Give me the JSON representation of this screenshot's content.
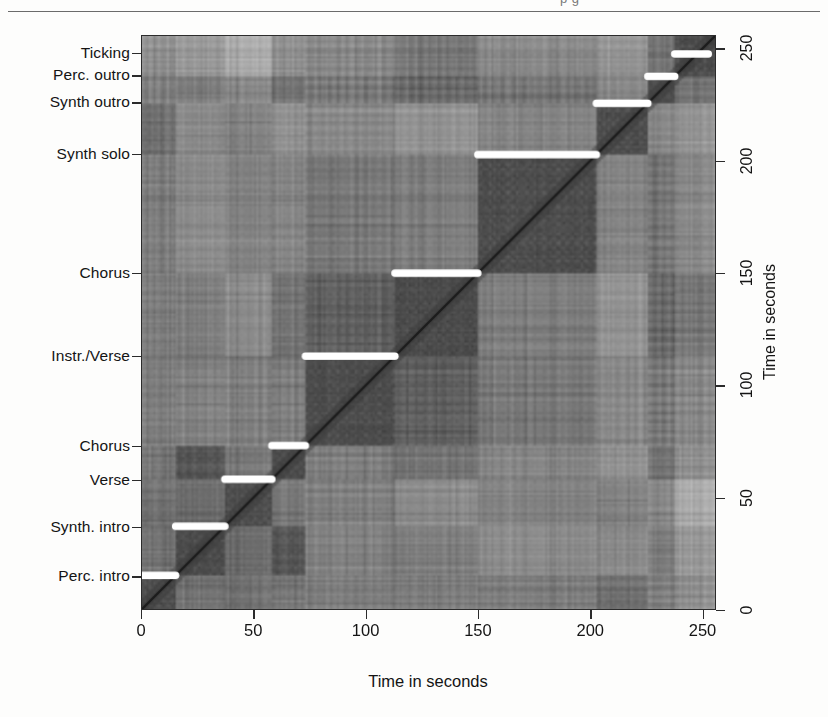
{
  "page": {
    "cut_off_header_text": "p   g",
    "has_horizontal_rule": true
  },
  "figure": {
    "type": "self-similarity-matrix",
    "background_gray": "#8d8d8d"
  },
  "axes": {
    "x": {
      "title": "Time in seconds",
      "ticks": [
        0,
        50,
        100,
        150,
        200,
        250
      ],
      "tick_labels": [
        "0",
        "50",
        "100",
        "150",
        "200",
        "250"
      ],
      "range": [
        0,
        256
      ]
    },
    "y_right": {
      "title": "Time in seconds",
      "ticks": [
        0,
        50,
        100,
        150,
        200,
        250
      ],
      "tick_labels": [
        "0",
        "50",
        "100",
        "150",
        "200",
        "250"
      ],
      "range": [
        0,
        256
      ]
    },
    "y_left": {
      "title": "",
      "segment_labels": [
        {
          "label": "Ticking",
          "time": 248
        },
        {
          "label": "Perc. outro",
          "time": 238
        },
        {
          "label": "Synth outro",
          "time": 226
        },
        {
          "label": "Synth solo",
          "time": 203
        },
        {
          "label": "Chorus",
          "time": 150
        },
        {
          "label": "Instr./Verse",
          "time": 113
        },
        {
          "label": "Chorus",
          "time": 73
        },
        {
          "label": "Verse",
          "time": 58
        },
        {
          "label": "Synth. intro",
          "time": 37
        },
        {
          "label": "Perc. intro",
          "time": 15
        }
      ]
    }
  },
  "chart_data": {
    "type": "heatmap",
    "title": "",
    "xlabel": "Time in seconds",
    "ylabel": "Time in seconds",
    "xlim": [
      0,
      256
    ],
    "ylim": [
      0,
      256
    ],
    "grid": false,
    "colormap": "grayscale",
    "segments": [
      {
        "name": "Perc. intro",
        "start": 0,
        "end": 15
      },
      {
        "name": "Synth. intro",
        "start": 15,
        "end": 37
      },
      {
        "name": "Verse",
        "start": 37,
        "end": 58
      },
      {
        "name": "Chorus",
        "start": 58,
        "end": 73
      },
      {
        "name": "Instr./Verse",
        "start": 73,
        "end": 113
      },
      {
        "name": "Chorus",
        "start": 113,
        "end": 150
      },
      {
        "name": "Synth solo",
        "start": 150,
        "end": 203
      },
      {
        "name": "Synth outro",
        "start": 203,
        "end": 226
      },
      {
        "name": "Perc. outro",
        "start": 226,
        "end": 238
      },
      {
        "name": "Ticking",
        "start": 238,
        "end": 256
      }
    ],
    "path_markers": [
      {
        "y": 15,
        "x_start": 0,
        "x_end": 15
      },
      {
        "y": 37,
        "x_start": 15,
        "x_end": 37
      },
      {
        "y": 58,
        "x_start": 37,
        "x_end": 58
      },
      {
        "y": 73,
        "x_start": 58,
        "x_end": 73
      },
      {
        "y": 113,
        "x_start": 73,
        "x_end": 113
      },
      {
        "y": 150,
        "x_start": 113,
        "x_end": 150
      },
      {
        "y": 203,
        "x_start": 150,
        "x_end": 203
      },
      {
        "y": 226,
        "x_start": 203,
        "x_end": 226
      },
      {
        "y": 238,
        "x_start": 226,
        "x_end": 238
      },
      {
        "y": 248,
        "x_start": 238,
        "x_end": 253
      }
    ],
    "diagonal": {
      "visible": true,
      "color": "#1c1c1c"
    }
  }
}
